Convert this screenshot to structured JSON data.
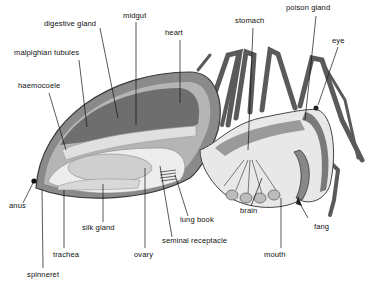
{
  "diagram": {
    "colors": {
      "background": "#ffffff",
      "label_text": "#111111",
      "leader_line": "#111111",
      "abdomen_outer": "#8a8a8a",
      "abdomen_dark": "#6e6e6e",
      "tissue_light": "#e6e6e6",
      "gland_fill": "#d2d2d2",
      "legs": "#5a5a5a"
    },
    "labels": [
      {
        "id": "digestive-gland",
        "text": "digestive gland"
      },
      {
        "id": "midgut",
        "text": "midgut"
      },
      {
        "id": "heart",
        "text": "heart"
      },
      {
        "id": "malpighian-tubules",
        "text": "malpighian tubules"
      },
      {
        "id": "haemocoele",
        "text": "haemocoele"
      },
      {
        "id": "stomach",
        "text": "stomach"
      },
      {
        "id": "poison-gland",
        "text": "poison gland"
      },
      {
        "id": "eye",
        "text": "eye"
      },
      {
        "id": "anus",
        "text": "anus"
      },
      {
        "id": "silk-gland",
        "text": "silk gland"
      },
      {
        "id": "trachea",
        "text": "trachea"
      },
      {
        "id": "spinneret",
        "text": "spinneret"
      },
      {
        "id": "ovary",
        "text": "ovary"
      },
      {
        "id": "seminal-receptacle",
        "text": "seminal receptacle"
      },
      {
        "id": "lung-book",
        "text": "lung book"
      },
      {
        "id": "brain",
        "text": "brain"
      },
      {
        "id": "fang",
        "text": "fang"
      },
      {
        "id": "mouth",
        "text": "mouth"
      }
    ]
  }
}
